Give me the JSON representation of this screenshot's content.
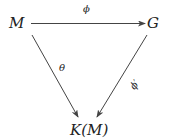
{
  "diagram": {
    "type": "commutative-triangle",
    "nodes": {
      "top_left": "M",
      "top_right": "G",
      "bottom": "K(M)"
    },
    "arrows": [
      {
        "from": "M",
        "to": "G",
        "label": "ϕ"
      },
      {
        "from": "M",
        "to": "K(M)",
        "label": "θ"
      },
      {
        "from": "G",
        "to": "K(M)",
        "label": "ϕ′"
      }
    ]
  }
}
